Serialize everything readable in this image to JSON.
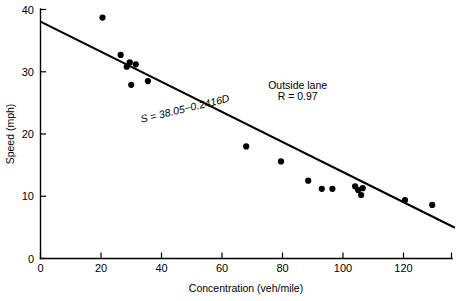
{
  "chart_data": {
    "type": "scatter",
    "title": "",
    "xlabel": "Concentration (veh/mile)",
    "ylabel": "Speed (mph)",
    "xlim": [
      0,
      137
    ],
    "ylim": [
      0,
      40
    ],
    "xticks": [
      0,
      20,
      40,
      60,
      80,
      100,
      120
    ],
    "xtick_labels": [
      "0",
      "20",
      "40",
      "60",
      "80",
      "100",
      "120"
    ],
    "yticks": [
      0,
      10,
      20,
      30,
      40
    ],
    "ytick_labels": [
      "0",
      "10",
      "20",
      "30",
      "40"
    ],
    "grid": false,
    "legend": null,
    "series": [
      {
        "name": "Outside lane observations",
        "marker": "filled-circle",
        "color": "#000000",
        "points": [
          {
            "x": 20.5,
            "y": 38.7
          },
          {
            "x": 26.5,
            "y": 32.7
          },
          {
            "x": 28.5,
            "y": 30.8
          },
          {
            "x": 29.5,
            "y": 31.5
          },
          {
            "x": 31.5,
            "y": 31.2
          },
          {
            "x": 30.0,
            "y": 27.9
          },
          {
            "x": 35.5,
            "y": 28.5
          },
          {
            "x": 68.0,
            "y": 18.0
          },
          {
            "x": 79.5,
            "y": 15.6
          },
          {
            "x": 88.5,
            "y": 12.5
          },
          {
            "x": 93.0,
            "y": 11.2
          },
          {
            "x": 96.5,
            "y": 11.2
          },
          {
            "x": 104.0,
            "y": 11.6
          },
          {
            "x": 105.0,
            "y": 11.0
          },
          {
            "x": 106.5,
            "y": 11.3
          },
          {
            "x": 106.0,
            "y": 10.2
          },
          {
            "x": 120.5,
            "y": 9.4
          },
          {
            "x": 129.5,
            "y": 8.6
          }
        ]
      }
    ],
    "fit_line": {
      "name": "Least-squares regression line",
      "equation": "S = 38.05−0.2416D",
      "intercept": 38.05,
      "slope": -0.2416,
      "x_start": 0,
      "x_end": 137,
      "y_start": 38.05,
      "y_end": 4.95
    },
    "annotations": [
      {
        "name": "equation-label",
        "text": "S = 38.05−0.2416D",
        "x": 48,
        "y": 23.5,
        "rotation": -13.5
      },
      {
        "name": "group-label",
        "text": "Outside lane",
        "x": 85,
        "y": 27.2
      },
      {
        "name": "correlation-label",
        "text": "R = 0.97",
        "x": 85,
        "y": 25.5
      }
    ]
  },
  "axes": {
    "y": {
      "title": "Speed (mph)",
      "ticks": [
        "0",
        "10",
        "20",
        "30",
        "40"
      ]
    },
    "x": {
      "title": "Concentration (veh/mile)",
      "ticks": [
        "0",
        "20",
        "40",
        "60",
        "80",
        "100",
        "120"
      ]
    }
  },
  "annotations": {
    "equation": "S = 38.05−0.2416D",
    "group": "Outside lane",
    "correlation": "R = 0.97"
  },
  "colors": {
    "marker": "#000000",
    "line": "#000000",
    "axis": "#000000",
    "background": "#ffffff"
  }
}
